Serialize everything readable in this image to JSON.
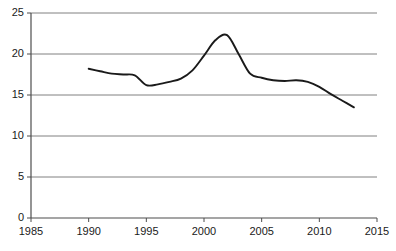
{
  "chart_data": {
    "type": "line",
    "title": "",
    "subtitle": "",
    "xlabel": "",
    "ylabel": "",
    "xlim": [
      1985,
      2015
    ],
    "ylim": [
      0,
      25
    ],
    "xticks": [
      1985,
      1990,
      1995,
      2000,
      2005,
      2010,
      2015
    ],
    "xtick_labels": [
      "1985",
      "1990",
      "1995",
      "2000",
      "2005",
      "2010",
      "2015"
    ],
    "yticks": [
      0,
      5,
      10,
      15,
      20,
      25
    ],
    "ytick_labels": [
      "0",
      "5",
      "10",
      "15",
      "20",
      "25"
    ],
    "grid": "horizontal",
    "legend": "none",
    "annotations": [],
    "series": [
      {
        "name": "series-1",
        "color": "#1a1a1a",
        "x": [
          1990,
          1991,
          1992,
          1993,
          1994,
          1995,
          1996,
          1997,
          1998,
          1999,
          2000,
          2001,
          2002,
          2003,
          2004,
          2005,
          2006,
          2007,
          2008,
          2009,
          2010,
          2011,
          2012,
          2013
        ],
        "values": [
          18.2,
          17.9,
          17.6,
          17.5,
          17.4,
          16.2,
          16.3,
          16.6,
          17.0,
          18.0,
          19.8,
          21.7,
          22.3,
          20.0,
          17.6,
          17.1,
          16.8,
          16.7,
          16.8,
          16.6,
          16.0,
          15.1,
          14.3,
          13.5
        ]
      }
    ]
  },
  "axis_colors": {
    "grid": "#808080",
    "axis": "#4d4d4d",
    "line": "#1a1a1a",
    "text": "#1a1a1a"
  }
}
